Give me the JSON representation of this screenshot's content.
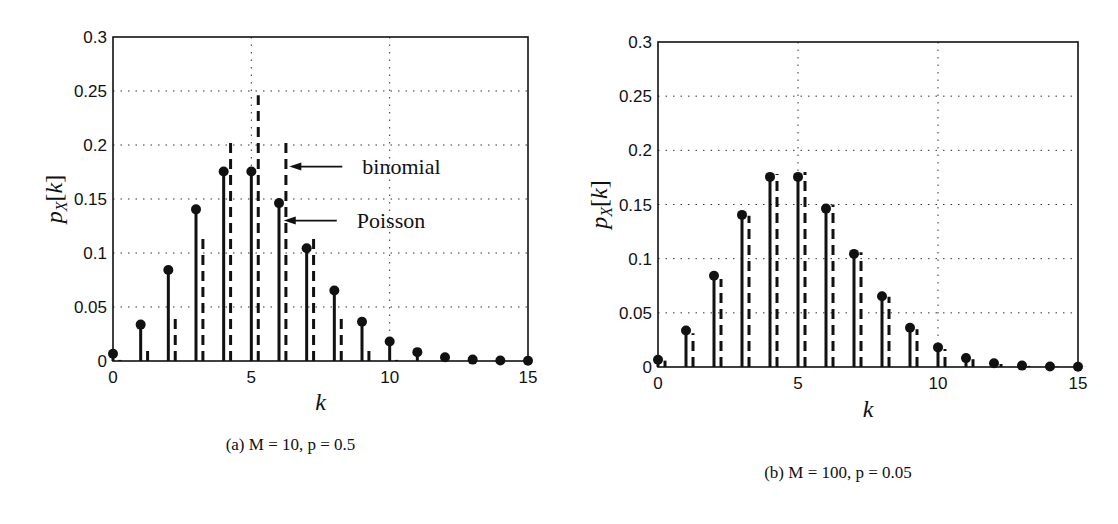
{
  "chart_data": [
    {
      "type": "bar",
      "subtype": "stem",
      "panel": "a",
      "caption": "(a) M = 10, p = 0.5",
      "xlabel": "k",
      "ylabel": "p_X[k]",
      "xlim": [
        0,
        15
      ],
      "ylim": [
        0,
        0.3
      ],
      "xticks": [
        0,
        5,
        10,
        15
      ],
      "yticks": [
        0,
        0.05,
        0.1,
        0.15,
        0.2,
        0.25,
        0.3
      ],
      "grid": true,
      "x": [
        0,
        1,
        2,
        3,
        4,
        5,
        6,
        7,
        8,
        9,
        10,
        11,
        12,
        13,
        14,
        15
      ],
      "series": [
        {
          "name": "Poisson",
          "style": "solid stem with dot",
          "values": [
            0.0067,
            0.0337,
            0.0842,
            0.1404,
            0.1755,
            0.1755,
            0.1462,
            0.1044,
            0.0653,
            0.0363,
            0.0181,
            0.0082,
            0.0034,
            0.0013,
            0.0005,
            0.0002
          ]
        },
        {
          "name": "binomial",
          "style": "dashed stem",
          "values": [
            0.001,
            0.0098,
            0.0439,
            0.1172,
            0.2051,
            0.2461,
            0.2051,
            0.1172,
            0.0439,
            0.0098,
            0.001,
            0,
            0,
            0,
            0,
            0
          ]
        }
      ],
      "annotations": [
        {
          "text": "binomial",
          "arrow_to_k": 6.25,
          "y": 0.18
        },
        {
          "text": "Poisson",
          "arrow_to_k": 6.05,
          "y": 0.13
        }
      ]
    },
    {
      "type": "bar",
      "subtype": "stem",
      "panel": "b",
      "caption": "(b) M = 100, p = 0.05",
      "xlabel": "k",
      "ylabel": "p_X[k]",
      "xlim": [
        0,
        15
      ],
      "ylim": [
        0,
        0.3
      ],
      "xticks": [
        0,
        5,
        10,
        15
      ],
      "yticks": [
        0,
        0.05,
        0.1,
        0.15,
        0.2,
        0.25,
        0.3
      ],
      "grid": true,
      "x": [
        0,
        1,
        2,
        3,
        4,
        5,
        6,
        7,
        8,
        9,
        10,
        11,
        12,
        13,
        14,
        15
      ],
      "series": [
        {
          "name": "Poisson",
          "style": "solid stem with dot",
          "values": [
            0.0067,
            0.0337,
            0.0842,
            0.1404,
            0.1755,
            0.1755,
            0.1462,
            0.1044,
            0.0653,
            0.0363,
            0.0181,
            0.0082,
            0.0034,
            0.0013,
            0.0005,
            0.0002
          ]
        },
        {
          "name": "binomial",
          "style": "dashed stem",
          "values": [
            0.0059,
            0.0312,
            0.0812,
            0.1396,
            0.1781,
            0.18,
            0.15,
            0.106,
            0.0649,
            0.0349,
            0.0167,
            0.0072,
            0.0028,
            0.001,
            0.0003,
            0.0001
          ]
        }
      ],
      "annotations": []
    }
  ],
  "panels": [
    {
      "caption": "(a) M = 10, p = 0.5",
      "box": {
        "x0": 113,
        "x1": 528,
        "y0": 37,
        "y1": 361
      },
      "ylabel_x": 62,
      "caption_y": 450,
      "xlabel_y": 410
    },
    {
      "caption": "(b) M = 100, p = 0.05",
      "box": {
        "x0": 658,
        "x1": 1078,
        "y0": 42,
        "y1": 367
      },
      "ylabel_x": 607,
      "caption_y": 478,
      "xlabel_y": 417
    }
  ]
}
